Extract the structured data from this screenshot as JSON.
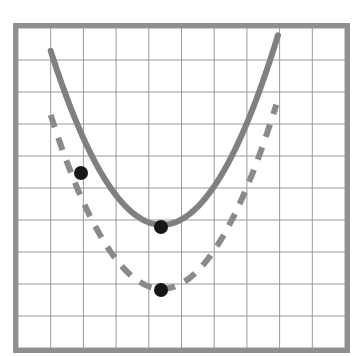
{
  "figure": {
    "kind": "graph-figure",
    "background_color": "#ffffff",
    "frame": {
      "name": "graph-border",
      "x": 18,
      "y": 28,
      "width": 327,
      "height": 320,
      "border_color": "#8f8f8f",
      "border_width": 5
    },
    "grid": {
      "columns": 10,
      "rows": 10,
      "cell_width": 32.2,
      "cell_height": 31.5,
      "line_color": "#9a9a9a",
      "line_width": 1,
      "visible": true
    }
  },
  "chart_data": {
    "type": "line",
    "title": "",
    "subtitle": "",
    "xlabel": "",
    "ylabel": "",
    "xlim": [
      0,
      10
    ],
    "ylim": [
      0,
      10
    ],
    "grid": true,
    "grid_spacing": 1,
    "legend": "none",
    "axis_tick_labels": {
      "x": [],
      "y": []
    },
    "series": [
      {
        "name": "solid-parabola",
        "style": "solid",
        "color": "#808080",
        "line_width": 6,
        "vertex": [
          4.4,
          3.85
        ],
        "a": 0.47,
        "x_start": 1.0,
        "x_end": 7.95,
        "points": [
          [
            1.0,
            9.23
          ],
          [
            1.35,
            8.3
          ],
          [
            1.7,
            7.44
          ],
          [
            2.05,
            6.65
          ],
          [
            2.4,
            5.92
          ],
          [
            2.75,
            5.25
          ],
          [
            3.1,
            4.66
          ],
          [
            3.45,
            4.13
          ],
          [
            3.8,
            3.68
          ],
          [
            4.15,
            3.3
          ],
          [
            4.4,
            3.85
          ],
          [
            4.75,
            3.91
          ],
          [
            5.1,
            4.1
          ],
          [
            5.45,
            4.37
          ],
          [
            5.8,
            4.79
          ],
          [
            6.15,
            5.28
          ],
          [
            6.5,
            5.85
          ],
          [
            6.85,
            6.48
          ],
          [
            7.2,
            7.19
          ],
          [
            7.55,
            7.96
          ],
          [
            7.95,
            9.23
          ]
        ],
        "marked_points": [
          {
            "name": "solid-left-point",
            "x": 1.95,
            "y": 5.4,
            "px": 81,
            "py": 173
          },
          {
            "name": "solid-vertex-point",
            "x": 4.4,
            "y": 3.85,
            "px": 161,
            "py": 227
          }
        ]
      },
      {
        "name": "dashed-parabola",
        "style": "dashed",
        "color": "#8a8a8a",
        "line_width": 6,
        "dash_length": 13,
        "dash_gap": 11,
        "vertex": [
          4.4,
          1.85
        ],
        "a": 0.47,
        "x_start": 1.0,
        "x_end": 7.9,
        "points": [
          [
            1.0,
            7.23
          ],
          [
            1.35,
            6.3
          ],
          [
            1.7,
            5.44
          ],
          [
            2.05,
            4.65
          ],
          [
            2.4,
            3.92
          ],
          [
            2.75,
            3.25
          ],
          [
            3.1,
            2.66
          ],
          [
            3.45,
            2.13
          ],
          [
            3.8,
            1.68
          ],
          [
            4.15,
            1.3
          ],
          [
            4.4,
            1.85
          ],
          [
            4.75,
            1.91
          ],
          [
            5.1,
            2.1
          ],
          [
            5.45,
            2.37
          ],
          [
            5.8,
            2.79
          ],
          [
            6.15,
            3.28
          ],
          [
            6.5,
            3.85
          ],
          [
            6.85,
            4.48
          ],
          [
            7.2,
            5.19
          ],
          [
            7.55,
            5.96
          ],
          [
            7.9,
            7.23
          ]
        ],
        "marked_points": [
          {
            "name": "dashed-vertex-point",
            "x": 4.4,
            "y": 1.85,
            "px": 161,
            "py": 290
          }
        ]
      }
    ],
    "point_marker": {
      "shape": "circle",
      "color": "#171717",
      "radius": 7
    }
  }
}
